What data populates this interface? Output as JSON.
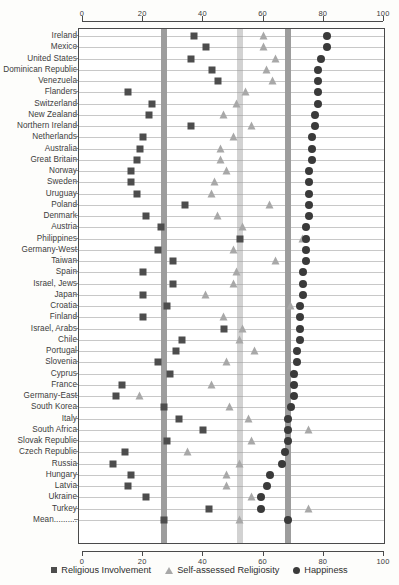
{
  "chart_data": {
    "type": "scatter",
    "title": "",
    "xlabel": "",
    "ylabel": "",
    "xlim": [
      0,
      100
    ],
    "xticks": [
      0,
      20,
      40,
      60,
      80,
      100
    ],
    "grid": true,
    "axis_top": true,
    "axis_bottom": true,
    "legend_position": "bottom",
    "series": [
      {
        "name": "Religious Involvement",
        "marker": "square",
        "color": "#4d4d4d"
      },
      {
        "name": "Self-assessed Religiosity",
        "marker": "triangle",
        "color": "#a8a8a8"
      },
      {
        "name": "Happiness",
        "marker": "circle",
        "color": "#3a3a3a"
      }
    ],
    "reference_bands": [
      {
        "name": "mean-religious-involvement",
        "value": 27,
        "color": "#9d9d9d"
      },
      {
        "name": "mean-self-assessed-religiosity",
        "value": 52,
        "color": "#d2d2d2"
      },
      {
        "name": "mean-happiness",
        "value": 68,
        "color": "#9d9d9d"
      }
    ],
    "categories": [
      "Ireland",
      "Mexico",
      "United States",
      "Dominican Republic",
      "Venezuela",
      "Flanders",
      "Switzerland",
      "New Zealand",
      "Northern Ireland",
      "Netherlands",
      "Australia",
      "Great Britain",
      "Norway",
      "Sweden",
      "Uruguay",
      "Poland",
      "Denmark",
      "Austria",
      "Philippines",
      "Germany-West",
      "Taiwan",
      "Spain",
      "Israel, Jews",
      "Japan",
      "Croatia",
      "Finland",
      "Israel, Arabs",
      "Chile",
      "Portugal",
      "Slovenia",
      "Cyprus",
      "France",
      "Germany-East",
      "South Korea",
      "Italy",
      "South Africa",
      "Slovak Republic",
      "Czech Republic",
      "Russia",
      "Hungary",
      "Latvia",
      "Ukraine",
      "Turkey",
      "Mean"
    ],
    "rows": [
      {
        "label": "Ireland",
        "religious_involvement": 37,
        "self_assessed_religiosity": 60,
        "happiness": 81
      },
      {
        "label": "Mexico",
        "religious_involvement": 41,
        "self_assessed_religiosity": 60,
        "happiness": 81
      },
      {
        "label": "United States",
        "religious_involvement": 36,
        "self_assessed_religiosity": 64,
        "happiness": 79
      },
      {
        "label": "Dominican Republic",
        "religious_involvement": 43,
        "self_assessed_religiosity": 61,
        "happiness": 78
      },
      {
        "label": "Venezuela",
        "religious_involvement": 45,
        "self_assessed_religiosity": 63,
        "happiness": 78
      },
      {
        "label": "Flanders",
        "religious_involvement": 15,
        "self_assessed_religiosity": 54,
        "happiness": 78
      },
      {
        "label": "Switzerland",
        "religious_involvement": 23,
        "self_assessed_religiosity": 51,
        "happiness": 78
      },
      {
        "label": "New Zealand",
        "religious_involvement": 22,
        "self_assessed_religiosity": 47,
        "happiness": 77
      },
      {
        "label": "Northern Ireland",
        "religious_involvement": 36,
        "self_assessed_religiosity": 56,
        "happiness": 77
      },
      {
        "label": "Netherlands",
        "religious_involvement": 20,
        "self_assessed_religiosity": 50,
        "happiness": 76
      },
      {
        "label": "Australia",
        "religious_involvement": 19,
        "self_assessed_religiosity": 46,
        "happiness": 76
      },
      {
        "label": "Great Britain",
        "religious_involvement": 18,
        "self_assessed_religiosity": 46,
        "happiness": 76
      },
      {
        "label": "Norway",
        "religious_involvement": 16,
        "self_assessed_religiosity": 48,
        "happiness": 75
      },
      {
        "label": "Sweden",
        "religious_involvement": 16,
        "self_assessed_religiosity": 44,
        "happiness": 75
      },
      {
        "label": "Uruguay",
        "religious_involvement": 18,
        "self_assessed_religiosity": 43,
        "happiness": 75
      },
      {
        "label": "Poland",
        "religious_involvement": 34,
        "self_assessed_religiosity": 62,
        "happiness": 75
      },
      {
        "label": "Denmark",
        "religious_involvement": 21,
        "self_assessed_religiosity": 45,
        "happiness": 75
      },
      {
        "label": "Austria",
        "religious_involvement": 26,
        "self_assessed_religiosity": 53,
        "happiness": 74
      },
      {
        "label": "Philippines",
        "religious_involvement": 52,
        "self_assessed_religiosity": 73,
        "happiness": 74
      },
      {
        "label": "Germany-West",
        "religious_involvement": 25,
        "self_assessed_religiosity": 50,
        "happiness": 74
      },
      {
        "label": "Taiwan",
        "religious_involvement": 30,
        "self_assessed_religiosity": 64,
        "happiness": 74
      },
      {
        "label": "Spain",
        "religious_involvement": 20,
        "self_assessed_religiosity": 51,
        "happiness": 73
      },
      {
        "label": "Israel, Jews",
        "religious_involvement": 30,
        "self_assessed_religiosity": 50,
        "happiness": 73
      },
      {
        "label": "Japan",
        "religious_involvement": 20,
        "self_assessed_religiosity": 41,
        "happiness": 73
      },
      {
        "label": "Croatia",
        "religious_involvement": 28,
        "self_assessed_religiosity": 69,
        "happiness": 72
      },
      {
        "label": "Finland",
        "religious_involvement": 20,
        "self_assessed_religiosity": 47,
        "happiness": 72
      },
      {
        "label": "Israel, Arabs",
        "religious_involvement": 47,
        "self_assessed_religiosity": 53,
        "happiness": 72
      },
      {
        "label": "Chile",
        "religious_involvement": 33,
        "self_assessed_religiosity": 52,
        "happiness": 72
      },
      {
        "label": "Portugal",
        "religious_involvement": 31,
        "self_assessed_religiosity": 57,
        "happiness": 71
      },
      {
        "label": "Slovenia",
        "religious_involvement": 25,
        "self_assessed_religiosity": 48,
        "happiness": 71
      },
      {
        "label": "Cyprus",
        "religious_involvement": 29,
        "self_assessed_religiosity": 70,
        "happiness": 70
      },
      {
        "label": "France",
        "religious_involvement": 13,
        "self_assessed_religiosity": 43,
        "happiness": 70
      },
      {
        "label": "Germany-East",
        "religious_involvement": 11,
        "self_assessed_religiosity": 19,
        "happiness": 70
      },
      {
        "label": "South Korea",
        "religious_involvement": 27,
        "self_assessed_religiosity": 49,
        "happiness": 69
      },
      {
        "label": "Italy",
        "religious_involvement": 32,
        "self_assessed_religiosity": 55,
        "happiness": 68
      },
      {
        "label": "South Africa",
        "religious_involvement": 40,
        "self_assessed_religiosity": 75,
        "happiness": 68
      },
      {
        "label": "Slovak Republic",
        "religious_involvement": 28,
        "self_assessed_religiosity": 56,
        "happiness": 68
      },
      {
        "label": "Czech Republic",
        "religious_involvement": 14,
        "self_assessed_religiosity": 35,
        "happiness": 67
      },
      {
        "label": "Russia",
        "religious_involvement": 10,
        "self_assessed_religiosity": 52,
        "happiness": 66
      },
      {
        "label": "Hungary",
        "religious_involvement": 16,
        "self_assessed_religiosity": 48,
        "happiness": 62
      },
      {
        "label": "Latvia",
        "religious_involvement": 15,
        "self_assessed_religiosity": 48,
        "happiness": 61
      },
      {
        "label": "Ukraine",
        "religious_involvement": 21,
        "self_assessed_religiosity": 56,
        "happiness": 59
      },
      {
        "label": "Turkey",
        "religious_involvement": 42,
        "self_assessed_religiosity": 75,
        "happiness": 59
      },
      {
        "label": "Mean",
        "religious_involvement": 27,
        "self_assessed_religiosity": 52,
        "happiness": 68
      }
    ]
  },
  "legend": {
    "items": [
      {
        "icon": "square-marker-icon",
        "label": "Religious Involvement"
      },
      {
        "icon": "triangle-marker-icon",
        "label": "Self-assessed Religiosity"
      },
      {
        "icon": "circle-marker-icon",
        "label": "Happiness"
      }
    ]
  },
  "mean_row_label": "Mean.........."
}
